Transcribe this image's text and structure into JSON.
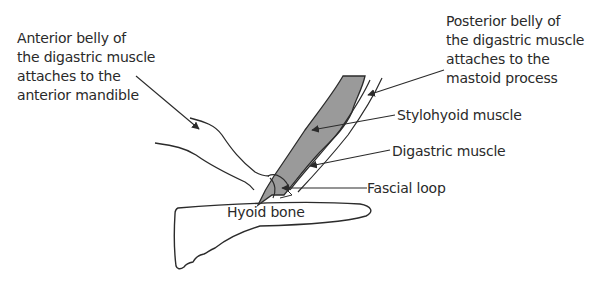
{
  "diagram": {
    "labels": {
      "anterior_belly": "Anterior belly of\nthe digastric muscle\nattaches to the\nanterior mandible",
      "posterior_belly": "Posterior belly of\nthe digastric muscle\nattaches to the\nmastoid process",
      "stylohyoid": "Stylohyoid muscle",
      "digastric": "Digastric muscle",
      "fascial_loop": "Fascial loop",
      "hyoid_bone": "Hyoid bone"
    },
    "colors": {
      "stroke": "#2b2b2b",
      "muscle_fill": "#9a9a9a",
      "background": "#ffffff"
    }
  }
}
